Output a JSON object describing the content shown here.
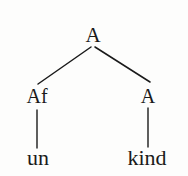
{
  "figure": {
    "kind": "syntax-tree",
    "background_color": "#fdfdfc",
    "ink_color": "#1a1a1a"
  },
  "tree": {
    "root": {
      "label": "A",
      "x": 93,
      "y": 35
    },
    "level2": [
      {
        "label": "Af",
        "x": 37,
        "y": 96
      },
      {
        "label": "A",
        "x": 148,
        "y": 96
      }
    ],
    "leaves": [
      {
        "label": "un",
        "x": 38,
        "y": 160
      },
      {
        "label": "kind",
        "x": 147,
        "y": 160
      }
    ],
    "edges": [
      {
        "name": "root-to-af",
        "x1": 91,
        "y1": 47,
        "x2": 38,
        "y2": 84
      },
      {
        "name": "root-to-a",
        "x1": 95,
        "y1": 47,
        "x2": 150,
        "y2": 82
      },
      {
        "name": "af-to-un",
        "x1": 37,
        "y1": 110,
        "x2": 37,
        "y2": 148
      },
      {
        "name": "a-to-kind",
        "x1": 148,
        "y1": 108,
        "x2": 148,
        "y2": 147
      }
    ]
  }
}
